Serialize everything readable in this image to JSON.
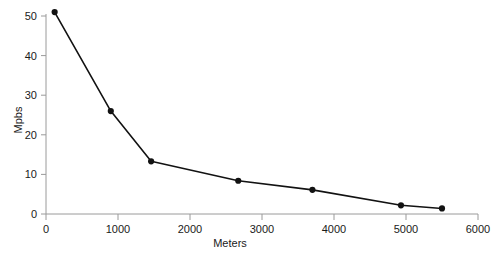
{
  "chart_data": {
    "type": "line",
    "title": "",
    "subtitle": "",
    "xlabel": "Meters",
    "ylabel": "Mpbs",
    "xlim": [
      0,
      6000
    ],
    "ylim": [
      0,
      50
    ],
    "xticks": [
      0,
      1000,
      2000,
      3000,
      4000,
      5000,
      6000
    ],
    "xtick_labels": [
      "0",
      "1000",
      "2000",
      "3000",
      "4000",
      "5000",
      "6000"
    ],
    "yticks": [
      0,
      10,
      20,
      30,
      40,
      50
    ],
    "ytick_labels": [
      "0",
      "10",
      "20",
      "30",
      "40",
      "50"
    ],
    "grid": false,
    "legend": false,
    "legend_position": "none",
    "markers": true,
    "marker_shape": "circle",
    "line_color": "#121212",
    "marker_color": "#121212",
    "axis_color": "#9a9a9a",
    "background_color": "#ffffff",
    "series": [
      {
        "name": "throughput",
        "x": [
          120,
          900,
          1460,
          2670,
          3700,
          4930,
          5500
        ],
        "values": [
          51.0,
          26.0,
          13.3,
          8.4,
          6.1,
          2.2,
          1.4
        ]
      }
    ]
  }
}
